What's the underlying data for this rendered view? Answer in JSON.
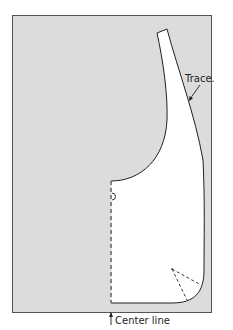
{
  "diagram": {
    "type": "sewing pattern tracing",
    "labels": {
      "trace": "Trace.",
      "center_line": "Center line"
    },
    "colors": {
      "paper_bg": "#dcdcdc",
      "pattern_fill": "#ffffff",
      "outline": "#231f20",
      "page_bg": "#ffffff"
    }
  }
}
